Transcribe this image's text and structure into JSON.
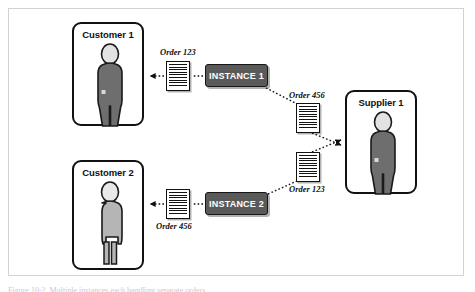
{
  "figure": {
    "type": "diagram",
    "caption": "Figure 10-2. Multiple instances each handling separate orders"
  },
  "entities": [
    {
      "id": "customer-1",
      "label": "Customer 1",
      "role": "customer",
      "figure_shade": "dark",
      "x": 72,
      "y": 22,
      "w": 72,
      "h": 104
    },
    {
      "id": "customer-2",
      "label": "Customer 2",
      "role": "customer",
      "figure_shade": "light",
      "x": 72,
      "y": 160,
      "w": 72,
      "h": 110
    },
    {
      "id": "supplier-1",
      "label": "Supplier 1",
      "role": "supplier",
      "figure_shade": "dark",
      "x": 345,
      "y": 90,
      "w": 72,
      "h": 104
    }
  ],
  "instances": [
    {
      "id": "instance-1",
      "label": "INSTANCE 1",
      "x": 205,
      "y": 64,
      "w": 63,
      "h": 23
    },
    {
      "id": "instance-2",
      "label": "INSTANCE 2",
      "x": 205,
      "y": 192,
      "w": 63,
      "h": 23
    }
  ],
  "documents": [
    {
      "id": "doc-order-123-to-customer-1",
      "order_label": "Order 123",
      "label_position": "above",
      "from": "instance-1",
      "to": "customer-1",
      "x": 166,
      "y": 61,
      "w": 24,
      "h": 30
    },
    {
      "id": "doc-order-456-to-supplier-1",
      "order_label": "Order 456",
      "label_position": "above",
      "from": "instance-1",
      "to": "supplier-1",
      "x": 296,
      "y": 103,
      "w": 24,
      "h": 30
    },
    {
      "id": "doc-order-456-to-customer-2",
      "order_label": "Order  456",
      "label_position": "below",
      "from": "instance-2",
      "to": "customer-2",
      "x": 166,
      "y": 189,
      "w": 24,
      "h": 30
    },
    {
      "id": "doc-order-123-to-supplier-1",
      "order_label": "Order 123",
      "label_position": "below",
      "from": "instance-2",
      "to": "supplier-1",
      "x": 296,
      "y": 152,
      "w": 24,
      "h": 30
    }
  ],
  "order_labels": {
    "top_customer": "Order 123",
    "top_supplier": "Order 456",
    "bottom_customer": "Order  456",
    "bottom_supplier": "Order 123"
  },
  "colors": {
    "instance_fill": "#5a5a5a",
    "instance_text": "#ffffff",
    "outline": "#111111",
    "figure_dark": "#6e6e6e",
    "figure_light": "#b5b5b5",
    "head_fill": "#e2e2e2",
    "frame_border": "#d2d2d2",
    "background": "#ffffff"
  }
}
